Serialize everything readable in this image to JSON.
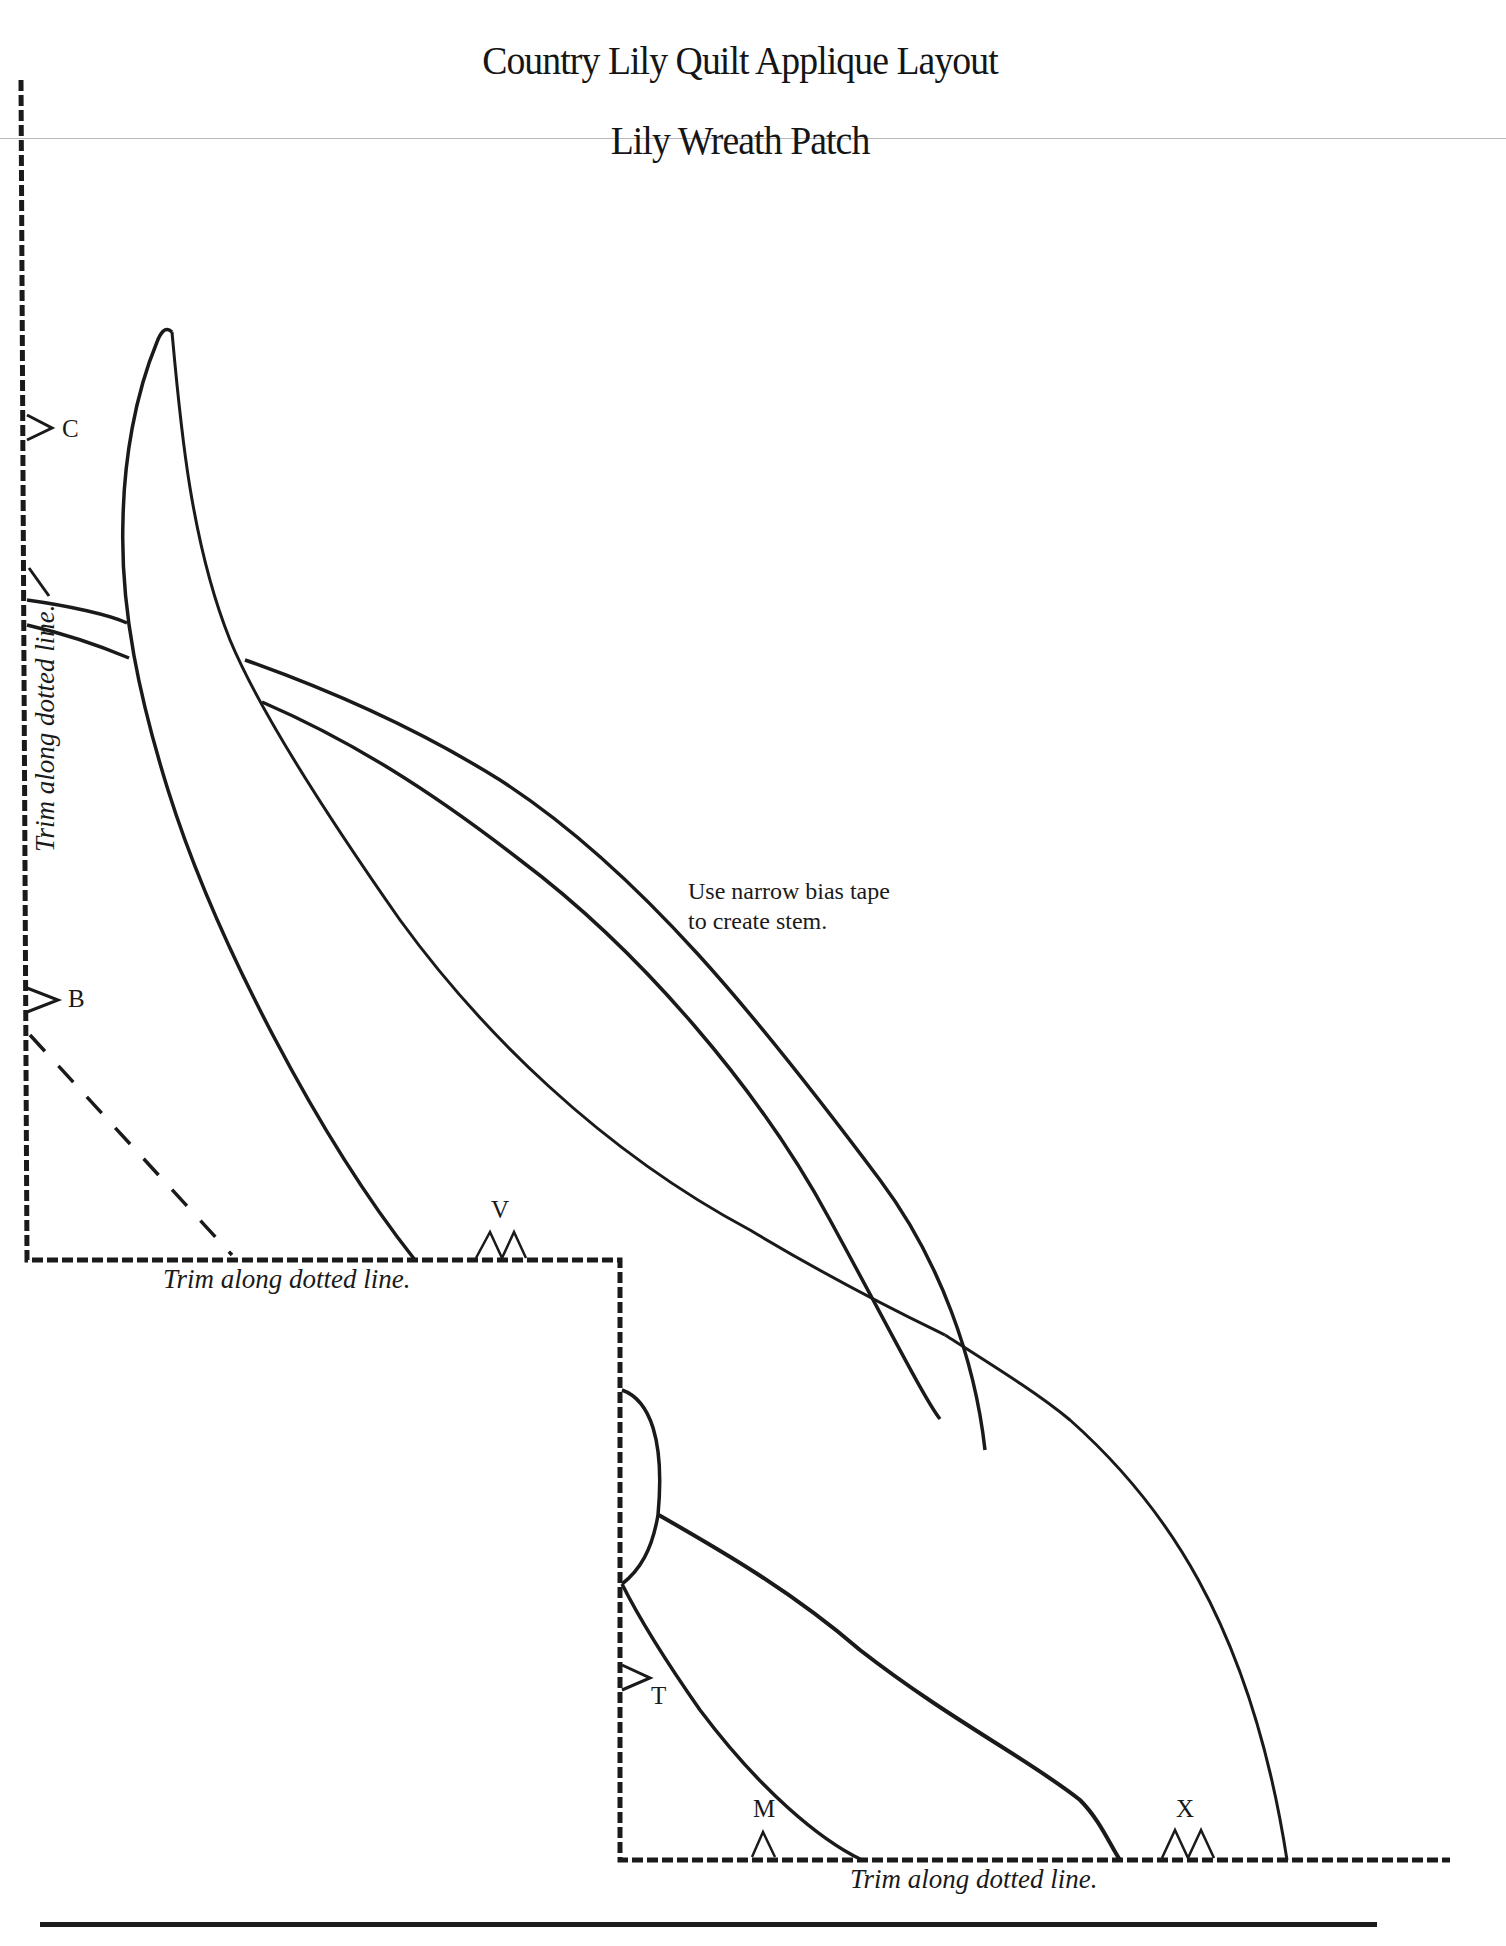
{
  "document": {
    "title": "Country Lily Quilt Applique Layout",
    "subtitle": "Lily Wreath Patch",
    "note": {
      "line1": "Use narrow bias tape",
      "line2": "to create stem."
    },
    "trim_labels": {
      "left": "Trim along dotted line.",
      "middle": "Trim along dotted line.",
      "bottom": "Trim along dotted line."
    },
    "markers": {
      "C": "C",
      "B": "B",
      "V": "V",
      "T": "T",
      "M": "M",
      "X": "X"
    },
    "colors": {
      "ink": "#1a1a1a",
      "paper": "#ffffff",
      "scan_line": "#b8b8b8"
    }
  }
}
